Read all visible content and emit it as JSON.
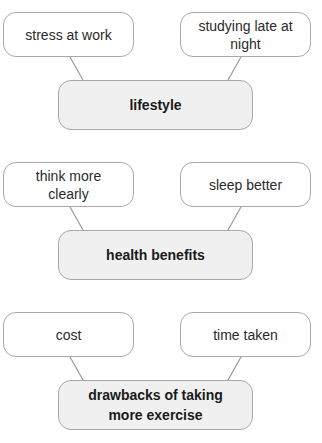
{
  "sections": [
    {
      "hub": "lifestyle",
      "left": "stress at work",
      "right": "studying late at night"
    },
    {
      "hub": "health benefits",
      "left": "think more clearly",
      "right": "sleep better"
    },
    {
      "hub": "drawbacks of taking more exercise",
      "left": "cost",
      "right": "time taken"
    }
  ],
  "colors": {
    "border": "#a8a8a8",
    "hub_fill": "#f0f0f0",
    "leaf_fill": "#ffffff",
    "connector": "#999999"
  }
}
